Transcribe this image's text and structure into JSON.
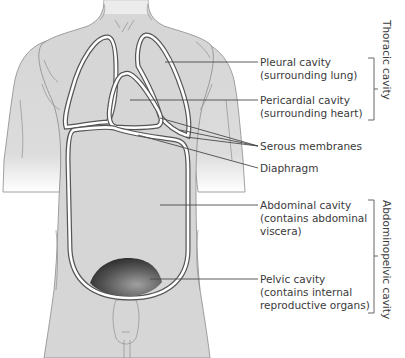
{
  "diagram": {
    "type": "anatomical-illustration",
    "colors": {
      "skin": "#d6d6d6",
      "cavity_dark": "#2e2e2e",
      "cavity_light": "#a9a9a9",
      "membrane": "#ffffff",
      "text": "#3a3a3a",
      "leader_line": "#4a4a4a"
    },
    "labels": [
      {
        "id": "pleural",
        "lines": [
          "Pleural cavity",
          "(surrounding lung)"
        ]
      },
      {
        "id": "pericardial",
        "lines": [
          "Pericardial cavity",
          "(surrounding heart)"
        ]
      },
      {
        "id": "serous",
        "lines": [
          "Serous membranes"
        ]
      },
      {
        "id": "diaphragm",
        "lines": [
          "Diaphragm"
        ]
      },
      {
        "id": "abdominal",
        "lines": [
          "Abdominal cavity",
          "(contains abdominal",
          "viscera)"
        ]
      },
      {
        "id": "pelvic",
        "lines": [
          "Pelvic cavity",
          "(contains internal",
          "reproductive organs)"
        ]
      }
    ],
    "groups": [
      {
        "id": "thoracic",
        "label": "Thoracic cavity",
        "members": [
          "pleural",
          "pericardial"
        ]
      },
      {
        "id": "abdominopelvic",
        "label": "Abdominopelvic cavity",
        "members": [
          "abdominal",
          "pelvic"
        ]
      }
    ]
  }
}
